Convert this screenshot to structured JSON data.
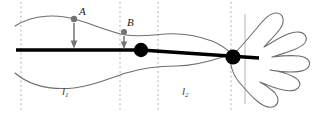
{
  "figure": {
    "background_color": "#ffffff"
  },
  "colors": {
    "outline": "#6e6e6e",
    "axis_line": "#000000",
    "joint_dot": "#000000",
    "marker_dot": "#737373",
    "arrow": "#737373",
    "dashed_guide": "#b4b4b4",
    "solid_guide": "#b4b4b4",
    "label_text": "#1a1a1a"
  },
  "labels": {
    "point_a": "A",
    "point_b": "B",
    "segment_1": "l",
    "segment_1_sub": "1",
    "segment_2": "l",
    "segment_2_sub": "2"
  },
  "markers": {
    "a_dot": {
      "cx": 74,
      "cy": 19,
      "r": 3.2
    },
    "b_dot": {
      "cx": 124,
      "cy": 32,
      "r": 3.0
    },
    "joint_1": {
      "cx": 141,
      "cy": 50,
      "r": 7.2
    },
    "joint_2": {
      "cx": 233,
      "cy": 57,
      "r": 7.6
    }
  },
  "arrows": [
    {
      "name": "arrow-a",
      "x": 74,
      "y_start": 23,
      "y_end": 47
    },
    {
      "name": "arrow-b",
      "x": 124,
      "y_start": 36,
      "y_end": 48
    }
  ],
  "guides": {
    "dashed_x": [
      21,
      120,
      158,
      231
    ],
    "solid_x": [
      245
    ],
    "y_top": 2,
    "y_bottom": 110
  },
  "axis_line": {
    "x_start": 16,
    "y_start": 50,
    "x_mid": 141,
    "y_mid": 50,
    "x_end": 259,
    "y_end": 58,
    "width": 3.4
  }
}
